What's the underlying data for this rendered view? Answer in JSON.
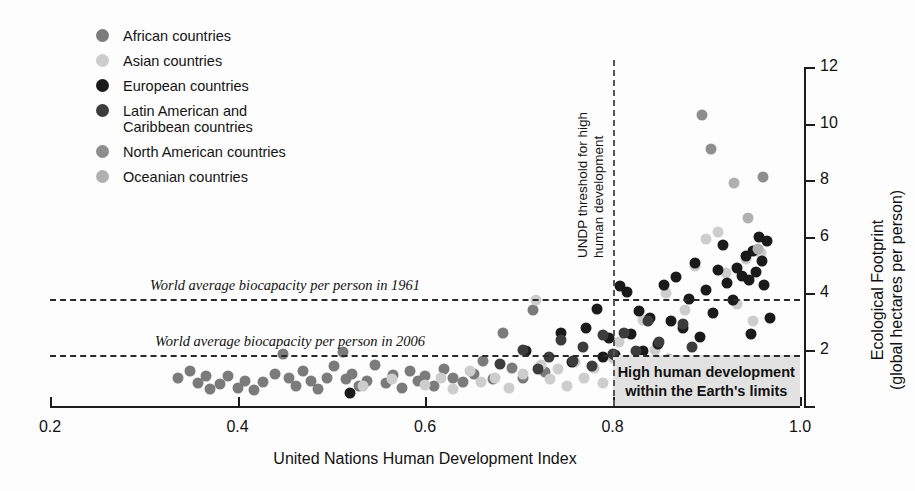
{
  "chart_data": {
    "type": "scatter",
    "title": "",
    "xlabel": "United Nations Human Development Index",
    "ylabel": "Ecological Footprint\n(global hectares per person)",
    "xlim": [
      0.2,
      1.0
    ],
    "ylim": [
      0,
      12
    ],
    "xticks": [
      0.2,
      0.4,
      0.6,
      0.8,
      1.0
    ],
    "xticklabels": [
      "0.2",
      "0.4",
      "0.6",
      "0.8",
      "1.0"
    ],
    "yticks": [
      0,
      2,
      4,
      6,
      8,
      10,
      12
    ],
    "yticklabels": [
      "",
      "2",
      "4",
      "6",
      "8",
      "10",
      "12"
    ],
    "y_axis_position": "right",
    "grid": false,
    "legend_position": "upper-left",
    "legend": [
      {
        "key": "african",
        "label": "African countries",
        "color": "#7b7b7b"
      },
      {
        "key": "asian",
        "label": "Asian countries",
        "color": "#cdcdcd"
      },
      {
        "key": "european",
        "label": "European countries",
        "color": "#1a1a1a"
      },
      {
        "key": "latin_american",
        "label": "Latin American and\nCaribbean countries",
        "color": "#3c3c3c"
      },
      {
        "key": "north_american",
        "label": "North American countries",
        "color": "#8e8e8e"
      },
      {
        "key": "oceanian",
        "label": "Oceanian countries",
        "color": "#b0b0b0"
      }
    ],
    "annotations": [
      {
        "name": "biocapacity-1961",
        "text": "World average biocapacity per person in 1961",
        "type": "hline",
        "y": 3.8
      },
      {
        "name": "biocapacity-2006",
        "text": "World average biocapacity per person in 2006",
        "type": "hline",
        "y": 1.8
      },
      {
        "name": "undp-threshold",
        "text": "UNDP threshold for high\nhuman development",
        "type": "vline",
        "x": 0.8
      },
      {
        "name": "safe-region",
        "text": "High human development\nwithin the Earth's limits",
        "type": "region",
        "x_range": [
          0.8,
          1.0
        ],
        "y_range": [
          0.0,
          1.8
        ]
      }
    ],
    "series": [
      {
        "name": "African countries",
        "color": "#7b7b7b",
        "points": [
          [
            0.336,
            1.0
          ],
          [
            0.349,
            1.25
          ],
          [
            0.358,
            0.8
          ],
          [
            0.366,
            1.05
          ],
          [
            0.371,
            0.6
          ],
          [
            0.381,
            0.78
          ],
          [
            0.39,
            1.05
          ],
          [
            0.4,
            0.62
          ],
          [
            0.408,
            0.9
          ],
          [
            0.418,
            0.55
          ],
          [
            0.427,
            0.85
          ],
          [
            0.44,
            1.15
          ],
          [
            0.448,
            1.85
          ],
          [
            0.455,
            1.0
          ],
          [
            0.462,
            0.72
          ],
          [
            0.47,
            1.25
          ],
          [
            0.478,
            0.88
          ],
          [
            0.486,
            0.6
          ],
          [
            0.495,
            1.0
          ],
          [
            0.503,
            1.4
          ],
          [
            0.512,
            1.9
          ],
          [
            0.516,
            0.95
          ],
          [
            0.522,
            1.15
          ],
          [
            0.53,
            0.7
          ],
          [
            0.538,
            0.9
          ],
          [
            0.547,
            1.45
          ],
          [
            0.558,
            0.82
          ],
          [
            0.566,
            1.1
          ],
          [
            0.575,
            0.65
          ],
          [
            0.584,
            1.25
          ],
          [
            0.592,
            0.9
          ],
          [
            0.6,
            1.05
          ],
          [
            0.61,
            0.7
          ],
          [
            0.62,
            1.3
          ],
          [
            0.63,
            1.0
          ],
          [
            0.64,
            0.85
          ],
          [
            0.652,
            1.15
          ],
          [
            0.662,
            1.6
          ],
          [
            0.672,
            0.95
          ],
          [
            0.683,
            2.6
          ],
          [
            0.693,
            1.35
          ],
          [
            0.705,
            1.0
          ],
          [
            0.715,
            3.4
          ],
          [
            0.728,
            1.2
          ]
        ]
      },
      {
        "name": "Asian countries",
        "color": "#cdcdcd",
        "points": [
          [
            0.534,
            0.72
          ],
          [
            0.565,
            0.95
          ],
          [
            0.6,
            0.75
          ],
          [
            0.617,
            1.0
          ],
          [
            0.63,
            0.6
          ],
          [
            0.648,
            1.25
          ],
          [
            0.66,
            0.85
          ],
          [
            0.675,
            1.0
          ],
          [
            0.69,
            0.65
          ],
          [
            0.705,
            1.15
          ],
          [
            0.718,
            3.75
          ],
          [
            0.724,
            1.45
          ],
          [
            0.733,
            0.95
          ],
          [
            0.742,
            1.3
          ],
          [
            0.751,
            0.7
          ],
          [
            0.76,
            1.55
          ],
          [
            0.77,
            1.0
          ],
          [
            0.78,
            1.35
          ],
          [
            0.79,
            0.8
          ],
          [
            0.8,
            1.7
          ],
          [
            0.807,
            2.25
          ],
          [
            0.82,
            1.15
          ],
          [
            0.832,
            3.05
          ],
          [
            0.845,
            2.0
          ],
          [
            0.857,
            4.0
          ],
          [
            0.865,
            1.5
          ],
          [
            0.877,
            3.4
          ],
          [
            0.888,
            4.95
          ],
          [
            0.9,
            5.9
          ],
          [
            0.912,
            6.15
          ],
          [
            0.921,
            4.7
          ],
          [
            0.933,
            3.6
          ],
          [
            0.942,
            5.2
          ],
          [
            0.95,
            3.0
          ],
          [
            0.958,
            5.4
          ]
        ]
      },
      {
        "name": "European countries",
        "color": "#1a1a1a",
        "points": [
          [
            0.52,
            0.45
          ],
          [
            0.708,
            1.95
          ],
          [
            0.745,
            2.6
          ],
          [
            0.757,
            1.55
          ],
          [
            0.772,
            2.75
          ],
          [
            0.783,
            3.45
          ],
          [
            0.79,
            1.75
          ],
          [
            0.796,
            2.4
          ],
          [
            0.803,
            1.8
          ],
          [
            0.808,
            4.25
          ],
          [
            0.815,
            4.05
          ],
          [
            0.82,
            2.55
          ],
          [
            0.828,
            3.35
          ],
          [
            0.833,
            1.95
          ],
          [
            0.84,
            3.1
          ],
          [
            0.848,
            2.2
          ],
          [
            0.855,
            4.3
          ],
          [
            0.862,
            3.0
          ],
          [
            0.868,
            4.55
          ],
          [
            0.875,
            2.75
          ],
          [
            0.882,
            3.8
          ],
          [
            0.888,
            5.05
          ],
          [
            0.893,
            2.45
          ],
          [
            0.9,
            4.1
          ],
          [
            0.907,
            3.3
          ],
          [
            0.912,
            4.8
          ],
          [
            0.918,
            5.7
          ],
          [
            0.922,
            4.35
          ],
          [
            0.928,
            3.75
          ],
          [
            0.933,
            4.9
          ],
          [
            0.938,
            4.6
          ],
          [
            0.942,
            5.3
          ],
          [
            0.946,
            4.45
          ],
          [
            0.95,
            5.5
          ],
          [
            0.953,
            4.75
          ],
          [
            0.956,
            6.0
          ],
          [
            0.959,
            5.15
          ],
          [
            0.962,
            4.3
          ],
          [
            0.965,
            5.85
          ],
          [
            0.968,
            3.1
          ],
          [
            0.948,
            2.55
          ],
          [
            0.935,
            1.3
          ]
        ]
      },
      {
        "name": "Latin American and Caribbean countries",
        "color": "#3c3c3c",
        "points": [
          [
            0.68,
            1.5
          ],
          [
            0.705,
            2.0
          ],
          [
            0.72,
            1.3
          ],
          [
            0.732,
            1.75
          ],
          [
            0.745,
            2.35
          ],
          [
            0.758,
            1.6
          ],
          [
            0.768,
            2.1
          ],
          [
            0.778,
            1.4
          ],
          [
            0.79,
            2.5
          ],
          [
            0.8,
            1.85
          ],
          [
            0.812,
            2.6
          ],
          [
            0.825,
            1.95
          ],
          [
            0.838,
            3.0
          ],
          [
            0.85,
            2.25
          ],
          [
            0.862,
            1.55
          ],
          [
            0.875,
            2.9
          ],
          [
            0.885,
            2.1
          ]
        ]
      },
      {
        "name": "North American countries",
        "color": "#8e8e8e",
        "points": [
          [
            0.895,
            10.3
          ],
          [
            0.905,
            9.1
          ],
          [
            0.96,
            8.1
          ]
        ]
      },
      {
        "name": "Oceanian countries",
        "color": "#b0b0b0",
        "points": [
          [
            0.86,
            1.65
          ],
          [
            0.93,
            7.9
          ],
          [
            0.945,
            6.65
          ],
          [
            0.955,
            5.55
          ]
        ]
      }
    ]
  },
  "axes": {
    "x_title": "United Nations Human Development Index",
    "y_title_line1": "Ecological Footprint",
    "y_title_line2": "(global hectares per person)"
  }
}
